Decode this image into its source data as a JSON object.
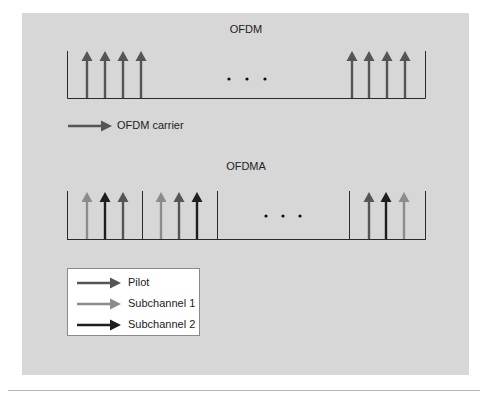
{
  "colors": {
    "background": "#d7d7d7",
    "pilot": "#555555",
    "subchannel_1": "#8c8c8c",
    "subchannel_2": "#1e1e1e",
    "ofdm_carrier": "#555555",
    "axis": "#2a2a2a"
  },
  "ofdm": {
    "title": "OFDM",
    "carrier_label": "OFDM carrier",
    "ellipsis": "• • •",
    "left_group": [
      {
        "x": 87,
        "type": "carrier"
      },
      {
        "x": 105,
        "type": "carrier"
      },
      {
        "x": 123,
        "type": "carrier"
      },
      {
        "x": 141,
        "type": "carrier"
      }
    ],
    "right_group": [
      {
        "x": 352,
        "type": "carrier"
      },
      {
        "x": 369,
        "type": "carrier"
      },
      {
        "x": 387,
        "type": "carrier"
      },
      {
        "x": 405,
        "type": "carrier"
      }
    ]
  },
  "ofdma": {
    "title": "OFDMA",
    "ellipsis": "• • •",
    "groups": [
      {
        "arrows": [
          {
            "x": 87,
            "type": "subchannel_1"
          },
          {
            "x": 105,
            "type": "subchannel_2"
          },
          {
            "x": 123,
            "type": "pilot"
          }
        ]
      },
      {
        "arrows": [
          {
            "x": 161,
            "type": "subchannel_1"
          },
          {
            "x": 179,
            "type": "pilot"
          },
          {
            "x": 197,
            "type": "subchannel_2"
          }
        ]
      },
      {
        "arrows": [
          {
            "x": 369,
            "type": "pilot"
          },
          {
            "x": 386,
            "type": "subchannel_2"
          },
          {
            "x": 404,
            "type": "subchannel_1"
          }
        ]
      }
    ],
    "dividers_x": [
      67,
      142,
      217,
      349,
      425
    ]
  },
  "legend": {
    "items": [
      {
        "label": "Pilot",
        "type": "pilot"
      },
      {
        "label": "Subchannel 1",
        "type": "subchannel_1"
      },
      {
        "label": "Subchannel 2",
        "type": "subchannel_2"
      }
    ]
  }
}
